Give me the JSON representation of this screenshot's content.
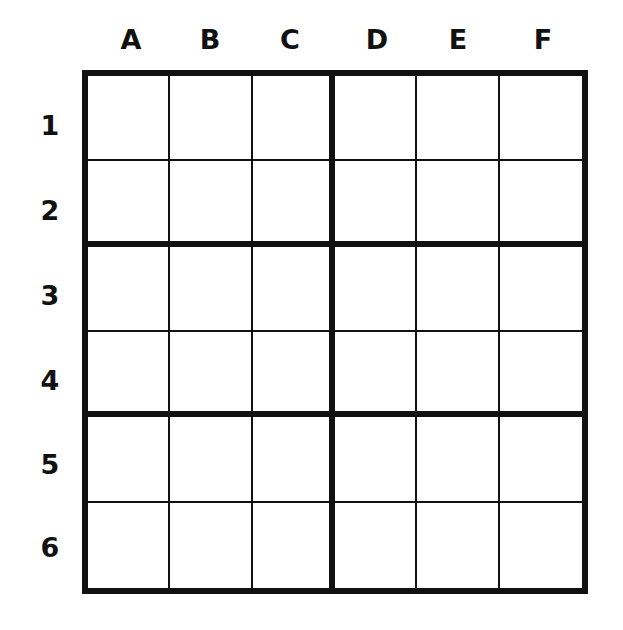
{
  "grid": {
    "rows": 6,
    "cols": 6,
    "box_width": 3,
    "box_height": 2,
    "line_color": "#111111",
    "background": "#ffffff"
  },
  "column_labels": [
    "A",
    "B",
    "C",
    "D",
    "E",
    "F"
  ],
  "row_labels": [
    "1",
    "2",
    "3",
    "4",
    "5",
    "6"
  ],
  "cells": [
    [
      "",
      "",
      "",
      "",
      "",
      ""
    ],
    [
      "",
      "",
      "",
      "",
      "",
      ""
    ],
    [
      "",
      "",
      "",
      "",
      "",
      ""
    ],
    [
      "",
      "",
      "",
      "",
      "",
      ""
    ],
    [
      "",
      "",
      "",
      "",
      "",
      ""
    ],
    [
      "",
      "",
      "",
      "",
      "",
      ""
    ]
  ]
}
